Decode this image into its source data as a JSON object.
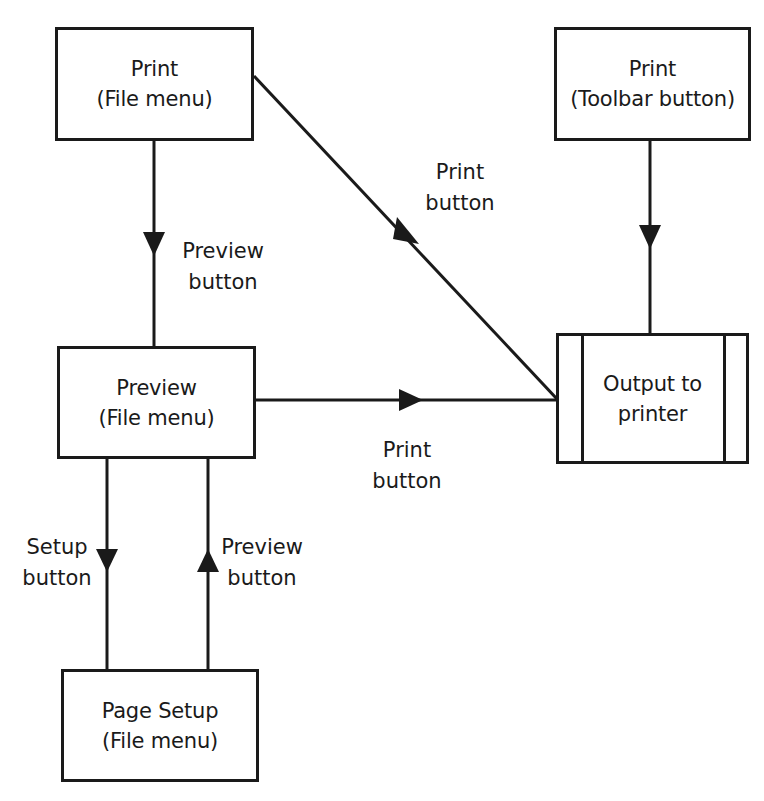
{
  "diagram": {
    "type": "flowchart",
    "colors": {
      "stroke": "#1a1a1a",
      "background": "#ffffff"
    },
    "nodes": [
      {
        "id": "print_file_menu",
        "lines": [
          "Print",
          "(File menu)"
        ],
        "shape": "rectangle"
      },
      {
        "id": "print_toolbar",
        "lines": [
          "Print",
          "(Toolbar button)"
        ],
        "shape": "rectangle"
      },
      {
        "id": "preview_file_menu",
        "lines": [
          "Preview",
          "(File menu)"
        ],
        "shape": "rectangle"
      },
      {
        "id": "output_printer",
        "lines": [
          "Output to",
          "printer"
        ],
        "shape": "predefined-process"
      },
      {
        "id": "page_setup_file_menu",
        "lines": [
          "Page Setup",
          "(File menu)"
        ],
        "shape": "rectangle"
      }
    ],
    "edges": [
      {
        "from": "print_file_menu",
        "to": "preview_file_menu",
        "label_lines": [
          "Preview",
          "button"
        ]
      },
      {
        "from": "print_file_menu",
        "to": "output_printer",
        "label_lines": [
          "Print",
          "button"
        ]
      },
      {
        "from": "print_toolbar",
        "to": "output_printer",
        "label_lines": []
      },
      {
        "from": "preview_file_menu",
        "to": "output_printer",
        "label_lines": [
          "Print",
          "button"
        ]
      },
      {
        "from": "preview_file_menu",
        "to": "page_setup_file_menu",
        "label_lines": [
          "Setup",
          "button"
        ]
      },
      {
        "from": "page_setup_file_menu",
        "to": "preview_file_menu",
        "label_lines": [
          "Preview",
          "button"
        ]
      }
    ]
  }
}
